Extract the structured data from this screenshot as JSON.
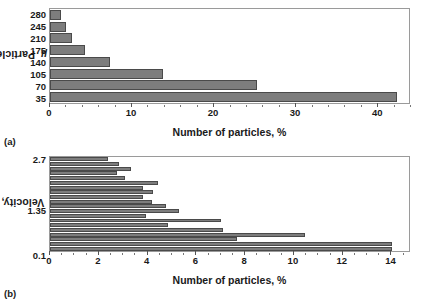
{
  "figure": {
    "panels": [
      {
        "caption": "(a)",
        "ylabel_text": "Particle size, ",
        "ylabel_symbol": "µ",
        "xlabel": "Number of particles, %"
      },
      {
        "caption": "(b)",
        "ylabel_text": "Velocity, m / s",
        "ylabel_symbol": "",
        "xlabel": "Number of particles, %"
      }
    ]
  },
  "chart_data": [
    {
      "type": "bar",
      "orientation": "horizontal",
      "panel": "(a)",
      "title": "",
      "xlabel": "Number of particles, %",
      "ylabel": "Particle size, µ",
      "categories": [
        "280",
        "245",
        "210",
        "175",
        "140",
        "105",
        "70",
        "35"
      ],
      "values": [
        1.3,
        1.9,
        2.7,
        4.3,
        7.3,
        13.9,
        25.4,
        42.5
      ],
      "xlim": [
        0,
        44
      ],
      "xticks": [
        0,
        10,
        20,
        30,
        40
      ],
      "xminor_step": 2,
      "yticks": [
        "280",
        "245",
        "210",
        "175",
        "140",
        "105",
        "70",
        "35"
      ],
      "grid": false,
      "legend": false,
      "bar_color": "#7d7d7d",
      "bar_edge_color": "#4a4a4a"
    },
    {
      "type": "bar",
      "orientation": "horizontal",
      "panel": "(b)",
      "title": "",
      "xlabel": "Number of particles, %",
      "ylabel": "Velocity, m / s",
      "categories": [
        "2.7",
        "2.563",
        "2.426",
        "2.289",
        "2.153",
        "2.016",
        "1.879",
        "1.742",
        "1.605",
        "1.468",
        "1.35",
        "1.195",
        "1.058",
        "0.921",
        "0.784",
        "0.647",
        "0.511",
        "0.374",
        "0.237",
        "0.1"
      ],
      "values": [
        2.4,
        2.85,
        3.35,
        2.75,
        3.1,
        4.45,
        3.85,
        4.25,
        3.85,
        4.2,
        4.8,
        5.3,
        3.95,
        7.05,
        4.85,
        7.15,
        10.5,
        7.7,
        14.1,
        14.1
      ],
      "xlim": [
        0,
        14.8
      ],
      "xticks": [
        0,
        2,
        4,
        6,
        8,
        10,
        12,
        14
      ],
      "xminor_step": 0.5,
      "yticks_visible": [
        "2.7",
        "1.35",
        "0.1"
      ],
      "grid": false,
      "legend": false,
      "bar_color": "#7d7d7d",
      "bar_edge_color": "#4a4a4a"
    }
  ]
}
